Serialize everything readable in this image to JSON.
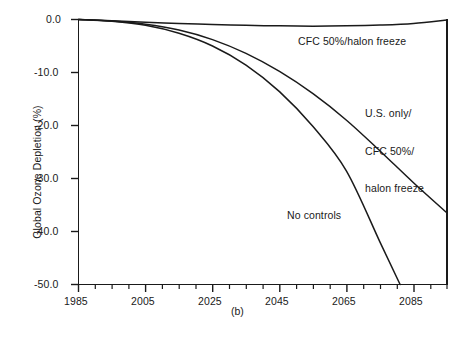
{
  "chart_data": {
    "type": "line",
    "title": "",
    "caption": "(b)",
    "xlabel": "",
    "ylabel": "Global Ozone Depletion (%)",
    "xlim": [
      1985,
      2095
    ],
    "ylim": [
      -50.0,
      0.0
    ],
    "grid": false,
    "legend_position": "inline-annotations",
    "x_ticks": [
      1985,
      2005,
      2025,
      2045,
      2065,
      2085
    ],
    "x_tick_labels": [
      "1985",
      "2005",
      "2025",
      "2045",
      "2065",
      "2085"
    ],
    "x_minor_tick_step": 5,
    "y_ticks": [
      0.0,
      -10.0,
      -20.0,
      -30.0,
      -40.0,
      -50.0
    ],
    "y_tick_labels": [
      "0.0",
      "-10.0",
      "-20.0",
      "-30.0",
      "-40.0",
      "-50.0"
    ],
    "series": [
      {
        "name": "CFC 50%/halon freeze",
        "label_lines": [
          "CFC 50%/halon freeze"
        ],
        "x": [
          1985,
          1995,
          2005,
          2015,
          2025,
          2035,
          2045,
          2055,
          2065,
          2075,
          2085,
          2095
        ],
        "values": [
          0.0,
          -0.25,
          -0.5,
          -0.75,
          -0.95,
          -1.1,
          -1.2,
          -1.25,
          -1.2,
          -1.05,
          -0.75,
          -0.1
        ]
      },
      {
        "name": "U.S. only/CFC 50%/halon freeze",
        "label_lines": [
          "U.S. only/",
          "CFC 50%/",
          "halon freeze"
        ],
        "x": [
          1985,
          1995,
          2005,
          2015,
          2025,
          2035,
          2045,
          2055,
          2065,
          2075,
          2085,
          2095
        ],
        "values": [
          0.0,
          -0.3,
          -0.9,
          -2.0,
          -3.8,
          -6.4,
          -9.8,
          -14.0,
          -19.0,
          -24.8,
          -30.8,
          -36.5
        ]
      },
      {
        "name": "No controls",
        "label_lines": [
          "No controls"
        ],
        "x": [
          1985,
          1995,
          2005,
          2015,
          2025,
          2035,
          2045,
          2055,
          2065,
          2075,
          2081
        ],
        "values": [
          0.0,
          -0.35,
          -1.1,
          -2.6,
          -5.0,
          -8.6,
          -13.6,
          -20.2,
          -28.6,
          -42.0,
          -50.0
        ]
      }
    ]
  },
  "axes": {
    "y_axis_title": "Global Ozone Depletion (%)",
    "figure_caption": "(b)"
  }
}
